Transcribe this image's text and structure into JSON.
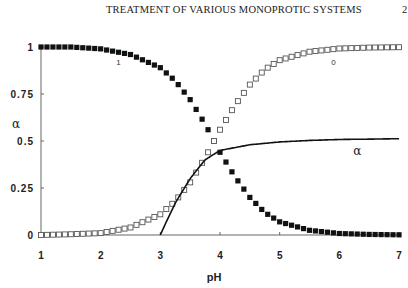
{
  "header": {
    "running_head": "TREATMENT OF VARIOUS MONOPROTIC SYSTEMS",
    "page_number": "2"
  },
  "chart_data": {
    "type": "scatter",
    "title": "",
    "xlabel": "pH",
    "ylabel": "α",
    "xlim": [
      1,
      7
    ],
    "ylim": [
      0,
      1
    ],
    "x_ticks": [
      "1",
      "2",
      "3",
      "4",
      "5",
      "6",
      "7"
    ],
    "y_ticks": [
      "0",
      "0.25",
      "0.5",
      "0.75",
      "1"
    ],
    "grid": false,
    "legend": "none (inline curve labels)",
    "annotations": [
      {
        "text": "1",
        "x": 2.3,
        "y": 0.92,
        "refers_to": "α1 (filled squares)"
      },
      {
        "text": "0",
        "x": 5.9,
        "y": 0.92,
        "refers_to": "α0 (open squares)"
      },
      {
        "text": "α",
        "x": 6.3,
        "y": 0.44,
        "refers_to": "solid line"
      }
    ],
    "series": [
      {
        "name": "1",
        "marker": "filled-square",
        "description": "α1, fraction decreasing with pH (sigmoid, pKa≈3.9)",
        "x": [
          1,
          1.5,
          2,
          2.5,
          3,
          3.25,
          3.5,
          3.75,
          3.9,
          4,
          4.25,
          4.5,
          4.75,
          5,
          5.5,
          6,
          6.5,
          7
        ],
        "values": [
          1.0,
          1.0,
          0.99,
          0.96,
          0.89,
          0.82,
          0.72,
          0.59,
          0.5,
          0.44,
          0.31,
          0.2,
          0.12,
          0.07,
          0.025,
          0.008,
          0.003,
          0.001
        ]
      },
      {
        "name": "0",
        "marker": "open-square",
        "description": "α0, fraction increasing with pH (sigmoid, pKa≈3.9)",
        "x": [
          1,
          1.5,
          2,
          2.5,
          3,
          3.25,
          3.5,
          3.75,
          3.9,
          4,
          4.25,
          4.5,
          4.75,
          5,
          5.5,
          6,
          6.5,
          7
        ],
        "values": [
          0.0,
          0.004,
          0.01,
          0.04,
          0.11,
          0.18,
          0.28,
          0.41,
          0.5,
          0.56,
          0.69,
          0.8,
          0.88,
          0.93,
          0.975,
          0.992,
          0.997,
          0.999
        ]
      },
      {
        "name": "α",
        "marker": "solid-line",
        "description": "solid curve starting at pH 3 rising to plateau ≈0.51",
        "x": [
          3,
          3.1,
          3.25,
          3.5,
          3.75,
          4,
          4.5,
          5,
          5.5,
          6,
          6.5,
          7
        ],
        "values": [
          0.0,
          0.07,
          0.17,
          0.3,
          0.4,
          0.45,
          0.48,
          0.495,
          0.503,
          0.508,
          0.51,
          0.512
        ]
      }
    ]
  }
}
